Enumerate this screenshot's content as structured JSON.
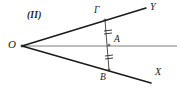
{
  "figure": {
    "panel_label": "(II)",
    "background_color": "#ffffff",
    "stroke_color": "#1a1a1a",
    "width": 180,
    "height": 89
  },
  "labels": {
    "vertex_o": "O",
    "point_gamma": "Γ",
    "point_a": "A",
    "point_b": "B",
    "ray_y": "Y",
    "ray_x": "X"
  },
  "geometry": {
    "vertex": {
      "name": "O",
      "x": 22,
      "y": 46
    },
    "points": [
      {
        "name": "Γ",
        "x": 105,
        "y": 20
      },
      {
        "name": "A",
        "x": 110,
        "y": 45
      },
      {
        "name": "B",
        "x": 109,
        "y": 70
      }
    ],
    "rays": [
      {
        "name": "OY",
        "from": "O",
        "to_label": "Y",
        "x1": 22,
        "y1": 46,
        "x2": 146,
        "y2": 8
      },
      {
        "name": "OX",
        "from": "O",
        "to_label": "X",
        "x1": 22,
        "y1": 46,
        "x2": 151,
        "y2": 83
      },
      {
        "name": "O-horizontal",
        "from": "O",
        "to_label": "",
        "x1": 22,
        "y1": 46,
        "x2": 177,
        "y2": 46
      }
    ],
    "segments": [
      {
        "name": "ΓA",
        "x1": 105,
        "y1": 20,
        "x2": 109,
        "y2": 45,
        "tick_marks": 2
      },
      {
        "name": "AB",
        "x1": 109,
        "y1": 45,
        "x2": 109,
        "y2": 70,
        "tick_marks": 2
      }
    ]
  },
  "label_positions": {
    "panel": {
      "x": 27,
      "y": 11
    },
    "vertex_o": {
      "x": 8,
      "y": 39
    },
    "point_gamma": {
      "x": 94,
      "y": 6
    },
    "point_a": {
      "x": 114,
      "y": 35
    },
    "point_b": {
      "x": 100,
      "y": 73
    },
    "ray_y": {
      "x": 150,
      "y": 2
    },
    "ray_x": {
      "x": 155,
      "y": 67
    }
  }
}
